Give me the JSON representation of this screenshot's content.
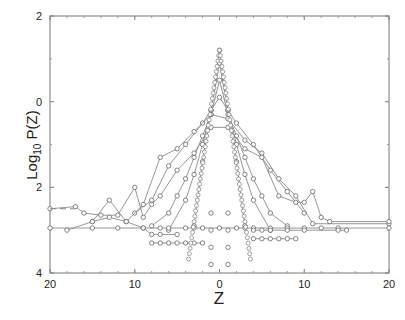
{
  "chart_data": {
    "type": "line",
    "title": "",
    "xlabel": "Z",
    "ylabel": "Log10 P(Z)",
    "ylabel_main": "Log",
    "ylabel_sub": "10",
    "ylabel_tail": " P(Z)",
    "xlim": [
      -20,
      20
    ],
    "ylim": [
      -4,
      2
    ],
    "x_ticks": [
      -20,
      -10,
      0,
      10,
      20
    ],
    "x_tick_labels": [
      "20",
      "10",
      "0",
      "10",
      "20"
    ],
    "y_ticks": [
      2,
      0,
      -2,
      -4
    ],
    "y_tick_labels": [
      "2",
      "0",
      "2",
      "4"
    ],
    "grid": false,
    "legend": null,
    "marker": "open-circle",
    "line_color": "#8a8a8a",
    "series": [
      {
        "name": "s1",
        "x": [
          -3,
          -2,
          -1,
          0,
          1,
          2,
          3
        ],
        "y": [
          -2.9,
          -1.4,
          -0.2,
          1.2,
          -0.2,
          -1.4,
          -2.9
        ]
      },
      {
        "name": "s2",
        "x": [
          -6,
          -4,
          -3,
          -2,
          -1,
          0,
          1,
          2,
          3,
          4,
          6
        ],
        "y": [
          -3.0,
          -2.3,
          -1.7,
          -1.0,
          -0.2,
          0.9,
          -0.2,
          -1.0,
          -1.7,
          -2.3,
          -3.0
        ]
      },
      {
        "name": "s3",
        "x": [
          -8,
          -6,
          -5,
          -4,
          -3,
          -2,
          -1,
          0,
          1,
          2,
          3,
          4,
          5,
          6,
          8
        ],
        "y": [
          -2.9,
          -2.6,
          -2.2,
          -1.8,
          -1.3,
          -0.8,
          -0.3,
          0.5,
          -0.3,
          -0.8,
          -1.3,
          -1.8,
          -2.2,
          -2.6,
          -2.9
        ]
      },
      {
        "name": "s4",
        "x": [
          -10,
          -8,
          -6,
          -4,
          -2,
          0,
          2,
          4,
          6,
          8,
          10
        ],
        "y": [
          -2.6,
          -2.3,
          -1.5,
          -1.0,
          -0.5,
          0.1,
          -0.5,
          -1.0,
          -1.6,
          -2.1,
          -2.6
        ]
      },
      {
        "name": "s5",
        "x": [
          -15,
          -13,
          -11,
          -9,
          -7,
          -5,
          -3,
          -1,
          1,
          3,
          5,
          7,
          9,
          11,
          20
        ],
        "y": [
          -2.8,
          -2.3,
          -2.8,
          -2.4,
          -1.3,
          -1.1,
          -0.7,
          -0.3,
          -0.4,
          -0.9,
          -1.2,
          -1.8,
          -2.2,
          -2.85,
          -2.85
        ]
      },
      {
        "name": "s6",
        "x": [
          -20,
          -17,
          -16,
          -14,
          -12,
          -10,
          -9,
          -8,
          -7,
          -5,
          -3,
          -1,
          1,
          3,
          5,
          7,
          9,
          10,
          11,
          12,
          13,
          20
        ],
        "y": [
          -2.5,
          -2.45,
          -2.6,
          -2.65,
          -2.65,
          -2.0,
          -2.7,
          -2.4,
          -2.2,
          -1.6,
          -1.2,
          -0.6,
          -0.6,
          -1.1,
          -1.3,
          -2.2,
          -2.35,
          -2.35,
          -2.1,
          -2.7,
          -2.8,
          -2.8
        ]
      },
      {
        "name": "s7",
        "x": [
          -20,
          -15,
          -12,
          -9,
          -7,
          -6,
          -4,
          -3,
          -2,
          0,
          2,
          3,
          4,
          6,
          8,
          10,
          12,
          14,
          20
        ],
        "y": [
          -2.95,
          -2.95,
          -2.95,
          -2.95,
          -2.95,
          -2.95,
          -2.95,
          -2.95,
          -2.95,
          -2.95,
          -2.95,
          -2.95,
          -2.95,
          -2.95,
          -2.95,
          -2.95,
          -2.95,
          -2.95,
          -2.95
        ]
      },
      {
        "name": "s8",
        "x": [
          -18,
          -15,
          -13,
          -11,
          -9,
          -8,
          -7,
          -5
        ],
        "y": [
          -3.0,
          -2.8,
          -2.7,
          -2.8,
          -2.95,
          -3.1,
          -3.1,
          -3.1
        ]
      },
      {
        "name": "s9",
        "x": [
          -8,
          -7,
          -6,
          -5,
          -4,
          -3,
          -2
        ],
        "y": [
          -3.3,
          -3.3,
          -3.3,
          -3.3,
          -3.3,
          -3.3,
          -3.3
        ]
      },
      {
        "name": "s10",
        "x": [
          4,
          5,
          6,
          8,
          10,
          14,
          15
        ],
        "y": [
          -3.0,
          -3.0,
          -3.0,
          -3.0,
          -3.0,
          -3.0,
          -3.0
        ]
      },
      {
        "name": "s11",
        "x": [
          4,
          5,
          6,
          7,
          8,
          9
        ],
        "y": [
          -3.2,
          -3.2,
          -3.2,
          -3.2,
          -3.2,
          -3.2
        ]
      },
      {
        "name": "s12",
        "x": [
          -1,
          -1,
          -1,
          -1,
          1,
          1,
          1,
          1
        ],
        "y": [
          -2.6,
          -3.0,
          -3.4,
          -3.8,
          -2.6,
          -3.0,
          -3.4,
          -3.8
        ]
      }
    ],
    "dashed_segment": {
      "x": [
        -20,
        -17
      ],
      "y": [
        -2.5,
        -2.5
      ]
    }
  }
}
